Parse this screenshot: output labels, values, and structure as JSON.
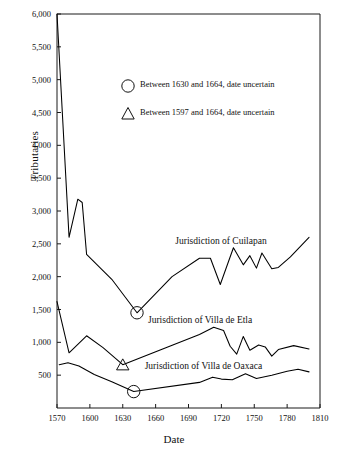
{
  "chart_data": {
    "type": "line",
    "title": "",
    "xlabel": "Date",
    "ylabel": "Tributaries",
    "xlim": [
      1570,
      1810
    ],
    "ylim": [
      0,
      6000
    ],
    "xticks": [
      1570,
      1600,
      1630,
      1660,
      1690,
      1720,
      1750,
      1780,
      1810
    ],
    "xticklabels": [
      "1570",
      "1600",
      "1630",
      "1660",
      "1690",
      "1720",
      "1750",
      "1780",
      "1810"
    ],
    "yticks": [
      500,
      1000,
      1500,
      2000,
      2500,
      3000,
      3500,
      4000,
      4500,
      5000,
      5500,
      6000
    ],
    "yticklabels": [
      "500",
      "1,000",
      "1,500",
      "2,000",
      "2,500",
      "3,000",
      "3,500",
      "4,000",
      "4,500",
      "5,000",
      "5,500",
      "6,000"
    ],
    "grid": false,
    "legend_position": "upper-center-inside",
    "series": [
      {
        "name": "Jurisdiction of Cuilapan",
        "color": "#000000",
        "points": [
          [
            1570,
            6000
          ],
          [
            1581,
            2600
          ],
          [
            1589,
            3180
          ],
          [
            1593,
            3130
          ],
          [
            1597,
            2340
          ],
          [
            1620,
            1960
          ],
          [
            1643,
            1450
          ],
          [
            1675,
            2000
          ],
          [
            1700,
            2280
          ],
          [
            1710,
            2280
          ],
          [
            1719,
            1880
          ],
          [
            1731,
            2440
          ],
          [
            1740,
            2180
          ],
          [
            1746,
            2320
          ],
          [
            1752,
            2130
          ],
          [
            1757,
            2360
          ],
          [
            1766,
            2120
          ],
          [
            1772,
            2140
          ],
          [
            1783,
            2300
          ],
          [
            1800,
            2600
          ]
        ]
      },
      {
        "name": "Jurisdiction of Villa de Etla",
        "color": "#000000",
        "points": [
          [
            1570,
            1620
          ],
          [
            1581,
            840
          ],
          [
            1597,
            1100
          ],
          [
            1612,
            920
          ],
          [
            1630,
            660
          ],
          [
            1700,
            1120
          ],
          [
            1713,
            1230
          ],
          [
            1722,
            1180
          ],
          [
            1728,
            940
          ],
          [
            1734,
            820
          ],
          [
            1740,
            1090
          ],
          [
            1746,
            880
          ],
          [
            1754,
            960
          ],
          [
            1760,
            930
          ],
          [
            1766,
            790
          ],
          [
            1772,
            890
          ],
          [
            1786,
            950
          ],
          [
            1800,
            900
          ]
        ]
      },
      {
        "name": "Jurisdiction of Villa de Oaxaca",
        "color": "#000000",
        "points": [
          [
            1572,
            660
          ],
          [
            1580,
            690
          ],
          [
            1590,
            640
          ],
          [
            1604,
            510
          ],
          [
            1620,
            400
          ],
          [
            1640,
            250
          ],
          [
            1700,
            390
          ],
          [
            1712,
            470
          ],
          [
            1720,
            440
          ],
          [
            1730,
            430
          ],
          [
            1742,
            520
          ],
          [
            1752,
            450
          ],
          [
            1766,
            500
          ],
          [
            1780,
            560
          ],
          [
            1790,
            590
          ],
          [
            1800,
            550
          ]
        ]
      }
    ],
    "markers": [
      {
        "shape": "circle",
        "x": 1643,
        "y": 1450,
        "series": "Jurisdiction of Cuilapan"
      },
      {
        "shape": "triangle",
        "x": 1630,
        "y": 660,
        "series": "Jurisdiction of Villa de Etla"
      },
      {
        "shape": "circle",
        "x": 1640,
        "y": 250,
        "series": "Jurisdiction of Villa de Oaxaca"
      }
    ],
    "legend": [
      {
        "marker": "circle",
        "label": "Between 1630 and 1664, date uncertain"
      },
      {
        "marker": "triangle",
        "label": "Between 1597 and 1664, date uncertain"
      }
    ],
    "annotations": [
      {
        "text": "Jurisdiction of Cuilapan",
        "x": 1678,
        "y": 2530
      },
      {
        "text": "Jurisdiction of Villa de Etla",
        "x": 1653,
        "y": 1330
      },
      {
        "text": "Jurisdiction of Villa de Oaxaca",
        "x": 1650,
        "y": 620
      }
    ]
  }
}
